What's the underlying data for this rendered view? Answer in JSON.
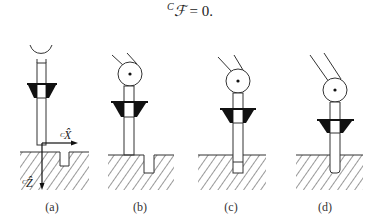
{
  "formula": {
    "superscript": "C",
    "symbol": "ℱ",
    "rest": " = 0."
  },
  "axes": {
    "x_label": "X̂",
    "x_prefix": "C",
    "z_label": "Ẑ",
    "z_prefix": "C"
  },
  "panels": [
    {
      "label": "(a)",
      "label_x": 52
    },
    {
      "label": "(b)",
      "label_x": 140
    },
    {
      "label": "(c)",
      "label_x": 231
    },
    {
      "label": "(d)",
      "label_x": 325
    }
  ],
  "colors": {
    "line": "#333333",
    "fill_dark": "#111111",
    "background": "#ffffff"
  }
}
